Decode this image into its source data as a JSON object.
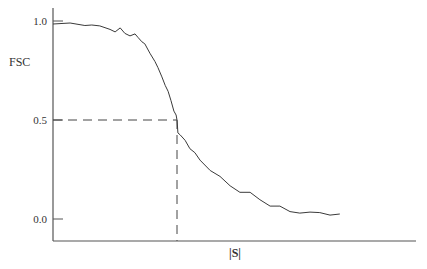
{
  "chart_data": {
    "type": "line",
    "title": "",
    "xlabel": "|S|",
    "ylabel": "FSC",
    "ylim": [
      0.0,
      1.0
    ],
    "yticks": [
      "1.0",
      "0.5",
      "0.0"
    ],
    "grid": false,
    "legend": null,
    "annotations": [
      {
        "type": "dashed-horizontal",
        "y": 0.5,
        "from_x": 0.0,
        "to_x": 0.343
      },
      {
        "type": "dashed-vertical",
        "x": 0.343,
        "from_y": 0.5,
        "to_y": -0.11
      }
    ],
    "x": [
      0.0,
      0.047,
      0.088,
      0.107,
      0.129,
      0.157,
      0.171,
      0.185,
      0.198,
      0.212,
      0.226,
      0.234,
      0.245,
      0.253,
      0.267,
      0.281,
      0.289,
      0.3,
      0.309,
      0.317,
      0.325,
      0.333,
      0.339,
      0.342,
      0.344,
      0.35,
      0.364,
      0.377,
      0.391,
      0.405,
      0.433,
      0.46,
      0.488,
      0.515,
      0.543,
      0.57,
      0.598,
      0.625,
      0.653,
      0.68,
      0.708,
      0.735,
      0.763,
      0.79
    ],
    "series": [
      {
        "name": "FSC",
        "values": [
          0.99,
          0.985,
          0.98,
          0.985,
          0.97,
          0.96,
          0.95,
          0.96,
          0.94,
          0.93,
          0.93,
          0.92,
          0.9,
          0.88,
          0.84,
          0.8,
          0.76,
          0.72,
          0.68,
          0.64,
          0.6,
          0.55,
          0.52,
          0.5,
          0.44,
          0.42,
          0.4,
          0.36,
          0.33,
          0.3,
          0.25,
          0.21,
          0.17,
          0.14,
          0.13,
          0.1,
          0.07,
          0.06,
          0.04,
          0.035,
          0.03,
          0.035,
          0.025,
          0.02
        ]
      }
    ]
  },
  "axes": {
    "y_label": "FSC",
    "x_label": "|S|",
    "y_ticks": [
      "1.0",
      "0.5",
      "0.0"
    ]
  },
  "colors": {
    "line": "#3a3a3a",
    "axis": "#555555",
    "dash": "#444444"
  }
}
